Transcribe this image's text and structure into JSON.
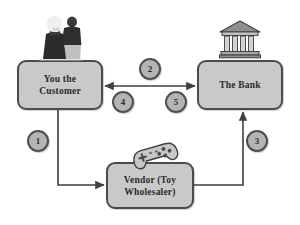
{
  "diagram": {
    "background_color": "#ffffff",
    "box_fill_color": "#c9c9c9",
    "box_border_color": "#4b4b4b",
    "circle_fill_color": "#b4b4b4",
    "circle_border_color": "#4f4f4f",
    "text_color": "#2b2b2b",
    "nodes": [
      {
        "id": "customer",
        "label_line1": "You the",
        "label_line2": "Customer",
        "icon": "couple-photo-icon"
      },
      {
        "id": "bank",
        "label_line1": "The Bank",
        "label_line2": "",
        "icon": "bank-building-icon"
      },
      {
        "id": "vendor",
        "label_line1": "Vendor (Toy",
        "label_line2": "Wholesaler)",
        "icon": "game-controller-icon"
      }
    ],
    "steps": [
      {
        "number": "1",
        "from": "customer",
        "to": "vendor"
      },
      {
        "number": "2",
        "from": "customer",
        "to": "bank"
      },
      {
        "number": "3",
        "from": "vendor",
        "to": "bank"
      },
      {
        "number": "4",
        "from": "bank",
        "to": "customer"
      },
      {
        "number": "5",
        "from": "customer",
        "to": "bank"
      }
    ]
  }
}
